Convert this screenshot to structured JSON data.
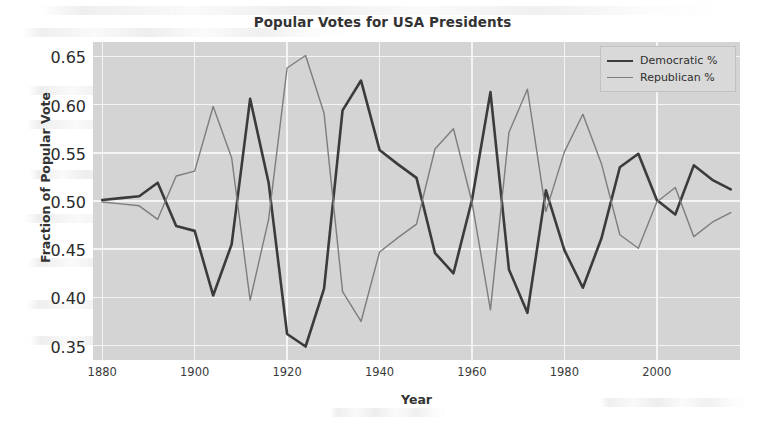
{
  "chart_data": {
    "type": "line",
    "title": "Popular Votes for USA Presidents",
    "xlabel": "Year",
    "ylabel": "Fraction of Popular Vote",
    "xlim": [
      1878,
      2018
    ],
    "ylim": [
      0.335,
      0.665
    ],
    "xticks": [
      1880,
      1900,
      1920,
      1940,
      1960,
      1980,
      2000
    ],
    "xtick_labels": [
      "1880",
      "1900",
      "1920",
      "1940",
      "1960",
      "1980",
      "2000"
    ],
    "yticks": [
      0.35,
      0.4,
      0.45,
      0.5,
      0.55,
      0.6,
      0.65
    ],
    "ytick_labels": [
      "0.35",
      "0.40",
      "0.45",
      "0.50",
      "0.55",
      "0.60",
      "0.65"
    ],
    "grid": true,
    "legend_position": "upper right",
    "x": [
      1880,
      1884,
      1888,
      1892,
      1896,
      1900,
      1904,
      1908,
      1912,
      1916,
      1920,
      1924,
      1928,
      1932,
      1936,
      1940,
      1944,
      1948,
      1952,
      1956,
      1960,
      1964,
      1968,
      1972,
      1976,
      1980,
      1984,
      1988,
      1992,
      1996,
      2000,
      2004,
      2008,
      2012,
      2016
    ],
    "series": [
      {
        "name": "Democratic %",
        "color": "#3b3b3b",
        "linewidth": 2.6,
        "values": [
          0.501,
          0.503,
          0.505,
          0.519,
          0.474,
          0.469,
          0.402,
          0.455,
          0.606,
          0.519,
          0.362,
          0.349,
          0.409,
          0.594,
          0.625,
          0.553,
          0.538,
          0.524,
          0.446,
          0.425,
          0.501,
          0.613,
          0.429,
          0.384,
          0.511,
          0.449,
          0.41,
          0.461,
          0.535,
          0.549,
          0.501,
          0.486,
          0.537,
          0.522,
          0.512
        ]
      },
      {
        "name": "Republican %",
        "color": "#7d7d7d",
        "linewidth": 1.4,
        "values": [
          0.499,
          0.497,
          0.495,
          0.481,
          0.526,
          0.531,
          0.598,
          0.545,
          0.397,
          0.481,
          0.638,
          0.651,
          0.591,
          0.406,
          0.375,
          0.447,
          0.462,
          0.476,
          0.554,
          0.575,
          0.499,
          0.387,
          0.571,
          0.616,
          0.489,
          0.551,
          0.59,
          0.539,
          0.465,
          0.451,
          0.499,
          0.514,
          0.463,
          0.478,
          0.488
        ]
      }
    ]
  },
  "legend": {
    "entries": [
      {
        "label": "Democratic %",
        "swatch": "dem"
      },
      {
        "label": "Republican %",
        "swatch": "rep"
      }
    ]
  }
}
